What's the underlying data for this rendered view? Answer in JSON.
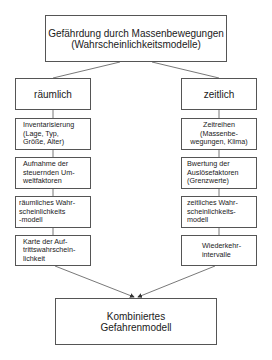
{
  "diagram": {
    "title": "Gefährdung durch Massenbewegungen\n(Wahrscheinlichkeitsmodelle)",
    "branches": {
      "left": {
        "label": "räumlich",
        "steps": [
          "Inventarisierung\n(Lage, Typ,\nGröße, Alter)",
          "Aufnahme der\nsteuernden Um-\nweltfaktoren",
          "räumliches Wahr-\nscheinlichkeits\n-modell",
          "Karte der Auf-\ntrittswahrschein-\nlichkeit"
        ]
      },
      "right": {
        "label": "zeitlich",
        "steps": [
          "Zeitreihen\n(Massenbe-\nwegungen, Klima)",
          "Bwertung der\nAuslösefaktoren\n(Grenzwerte)",
          "zeitliches Wahr-\nscheinlichkeits-\nmodell",
          "Wiederkehr-\nintervalle"
        ]
      }
    },
    "result": "Kombiniertes\nGefahrenmodell"
  },
  "colors": {
    "line": "#555555",
    "text": "#1a1a1a",
    "background": "#ffffff"
  }
}
